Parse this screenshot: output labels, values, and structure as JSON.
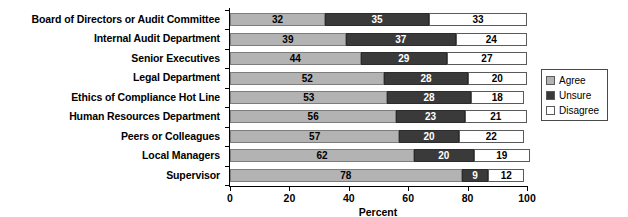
{
  "chart_data": {
    "type": "bar",
    "orientation": "horizontal",
    "stacked": true,
    "title": "",
    "xlabel": "Percent",
    "ylabel": "",
    "xlim": [
      0,
      100
    ],
    "xticks": [
      0,
      20,
      40,
      60,
      80,
      100
    ],
    "xticklabels": [
      "0",
      "20",
      "40",
      "60",
      "80",
      "100"
    ],
    "grid": false,
    "legend_position": "right",
    "categories": [
      "Board of Directors or Audit Committee",
      "Internal Audit Department",
      "Senior Executives",
      "Legal Department",
      "Ethics of Compliance Hot Line",
      "Human Resources Department",
      "Peers or Colleagues",
      "Local Managers",
      "Supervisor"
    ],
    "series": [
      {
        "name": "Agree",
        "color": "#b3b3b3",
        "values": [
          32,
          39,
          44,
          52,
          53,
          56,
          57,
          62,
          78
        ]
      },
      {
        "name": "Unsure",
        "color": "#3a3a3a",
        "values": [
          35,
          37,
          29,
          28,
          28,
          23,
          20,
          20,
          9
        ]
      },
      {
        "name": "Disagree",
        "color": "#ffffff",
        "values": [
          33,
          24,
          27,
          20,
          18,
          21,
          22,
          19,
          12
        ]
      }
    ]
  },
  "legend": {
    "items": [
      {
        "label": "Agree"
      },
      {
        "label": "Unsure"
      },
      {
        "label": "Disagree"
      }
    ]
  }
}
